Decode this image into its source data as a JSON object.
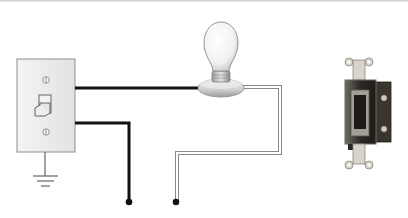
{
  "diagram": {
    "components": [
      {
        "id": "wall-switch",
        "label": "Toggle wall switch",
        "type": "switch-plate"
      },
      {
        "id": "ground",
        "label": "Ground",
        "type": "ground-symbol"
      },
      {
        "id": "light-bulb",
        "label": "Light bulb in socket",
        "type": "lamp"
      },
      {
        "id": "switch-device",
        "label": "Single-pole switch device",
        "type": "photo"
      }
    ],
    "wires": [
      {
        "id": "hot-to-lamp",
        "style": "black",
        "from": "wall-switch",
        "to": "light-bulb"
      },
      {
        "id": "hot-supply",
        "style": "black",
        "from": "wall-switch",
        "to": "terminal-1"
      },
      {
        "id": "neutral",
        "style": "white",
        "from": "light-bulb",
        "to": "terminal-2"
      }
    ],
    "terminals": [
      "terminal-1",
      "terminal-2"
    ],
    "colors": {
      "black_wire": "#111111",
      "white_wire_outline": "#8a8a8a",
      "plate": "#ededed",
      "plate_border": "#9a9a9a",
      "device_body": "#2a2622",
      "device_frame": "#a09b93"
    }
  }
}
